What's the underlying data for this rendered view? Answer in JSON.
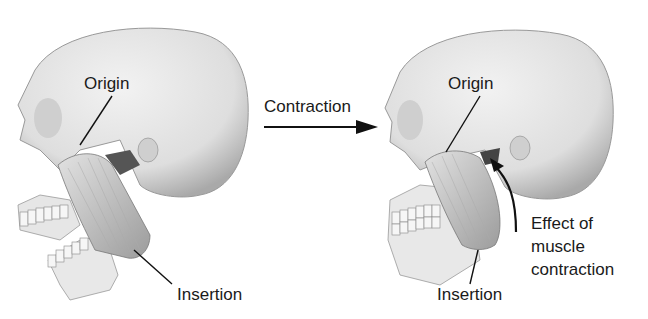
{
  "diagram": {
    "left_panel": {
      "state": "relaxed (jaw open)",
      "labels": {
        "origin": "Origin",
        "insertion": "Insertion"
      }
    },
    "transition": {
      "label": "Contraction"
    },
    "right_panel": {
      "state": "contracted (jaw closed)",
      "labels": {
        "origin": "Origin",
        "insertion": "Insertion",
        "effect_line1": "Effect of",
        "effect_line2": "muscle",
        "effect_line3": "contraction"
      }
    },
    "colors": {
      "bone": "#e4e4e4",
      "bone_shadow": "#b8b8b8",
      "muscle": "#c9c9c9",
      "ink": "#1a1a1a"
    }
  }
}
